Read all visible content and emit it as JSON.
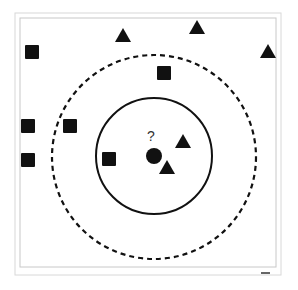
{
  "diagram": {
    "query_label": "?",
    "colors": {
      "ink": "#111111",
      "frame_outer": "#d8d8d8",
      "frame_inner": "#c8c8c8",
      "background": "#ffffff"
    },
    "query_point": {
      "x": 154,
      "y": 156,
      "r": 8
    },
    "inner_circle": {
      "cx": 154,
      "cy": 156,
      "r": 58,
      "style": "solid"
    },
    "outer_circle": {
      "cx": 154,
      "cy": 157,
      "r": 102,
      "style": "dashed"
    },
    "squares": [
      {
        "x": 32,
        "y": 52
      },
      {
        "x": 164,
        "y": 73
      },
      {
        "x": 28,
        "y": 126
      },
      {
        "x": 70,
        "y": 126
      },
      {
        "x": 28,
        "y": 160
      },
      {
        "x": 109,
        "y": 159
      }
    ],
    "triangles": [
      {
        "x": 123,
        "y": 36
      },
      {
        "x": 197,
        "y": 28
      },
      {
        "x": 268,
        "y": 52
      },
      {
        "x": 183,
        "y": 142
      },
      {
        "x": 167,
        "y": 168
      }
    ]
  }
}
